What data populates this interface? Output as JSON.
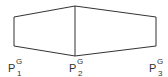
{
  "diagram": {
    "stroke_color": "#333333",
    "vertices": {
      "left_top": [
        14,
        17
      ],
      "left_bottom": [
        14,
        46
      ],
      "mid_top": [
        75,
        6
      ],
      "mid_bottom": [
        75,
        56
      ],
      "right_top": [
        156,
        17
      ],
      "right_bottom": [
        156,
        46
      ]
    },
    "labels": [
      {
        "base": "P",
        "sup": "G",
        "sub": "1"
      },
      {
        "base": "P",
        "sup": "G",
        "sub": "2"
      },
      {
        "base": "P",
        "sup": "G",
        "sub": "3"
      }
    ]
  }
}
